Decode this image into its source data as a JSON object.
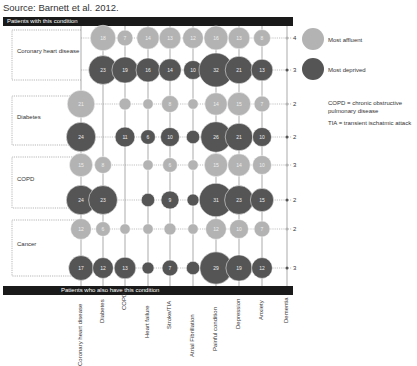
{
  "source": "Source: Barnett et al. 2012.",
  "top_bar_label": "Patients with this condition",
  "bottom_bar_label": "Patients who also have this condition",
  "legend": {
    "affluent": {
      "label": "Most affluent",
      "color": "#b3b3b3"
    },
    "deprived": {
      "label": "Most deprived",
      "color": "#555555"
    },
    "notes": [
      "COPD = chronic obstructive pulmonary disease",
      "TIA = transient ischatmic attack"
    ]
  },
  "chart_data": {
    "type": "bubble-matrix",
    "title": "",
    "row_conditions": [
      "Coronary heart disease",
      "Diabetes",
      "COPD",
      "Cancer"
    ],
    "column_conditions": [
      "Coronary heart disease",
      "Diabetes",
      "COPD",
      "Heart failure",
      "Stroke/TIA",
      "Atrial Fibrillation",
      "Painful condition",
      "Depression",
      "Anxiety",
      "Dementia"
    ],
    "series": [
      {
        "row": "Coronary heart disease",
        "name": "Most affluent",
        "values": [
          null,
          18,
          7,
          14,
          13,
          12,
          16,
          13,
          8,
          4
        ]
      },
      {
        "row": "Coronary heart disease",
        "name": "Most deprived",
        "values": [
          null,
          23,
          19,
          16,
          14,
          10,
          32,
          21,
          13,
          3
        ]
      },
      {
        "row": "Diabetes",
        "name": "Most affluent",
        "values": [
          21,
          null,
          4,
          3,
          8,
          3,
          14,
          15,
          7,
          2
        ]
      },
      {
        "row": "Diabetes",
        "name": "Most deprived",
        "values": [
          24,
          null,
          11,
          6,
          10,
          5,
          26,
          21,
          10,
          2
        ]
      },
      {
        "row": "COPD",
        "name": "Most affluent",
        "values": [
          15,
          8,
          null,
          3,
          6,
          3,
          15,
          14,
          10,
          3
        ]
      },
      {
        "row": "COPD",
        "name": "Most deprived",
        "values": [
          24,
          23,
          null,
          5,
          9,
          4,
          31,
          23,
          15,
          2
        ]
      },
      {
        "row": "Cancer",
        "name": "Most affluent",
        "values": [
          12,
          6,
          3,
          3,
          4,
          3,
          12,
          10,
          7,
          2
        ]
      },
      {
        "row": "Cancer",
        "name": "Most deprived",
        "values": [
          17,
          12,
          13,
          4,
          7,
          5,
          29,
          19,
          12,
          3
        ]
      }
    ],
    "units": "percent of patients",
    "legend_position": "right"
  }
}
